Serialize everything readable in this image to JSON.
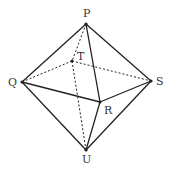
{
  "diagram": {
    "type": "octahedron",
    "colors": {
      "line": "#222222",
      "label": "#333333",
      "background": "#ffffff"
    },
    "vertices": {
      "P": {
        "label": "P",
        "x": 86,
        "y": 24,
        "lx": 83,
        "ly": 17
      },
      "T": {
        "label": "T",
        "x": 72,
        "y": 61,
        "lx": 77,
        "ly": 60
      },
      "Q": {
        "label": "Q",
        "x": 22,
        "y": 82,
        "lx": 8,
        "ly": 86
      },
      "S": {
        "label": "S",
        "x": 151,
        "y": 81,
        "lx": 156,
        "ly": 85
      },
      "R": {
        "label": "R",
        "x": 100,
        "y": 102,
        "lx": 104,
        "ly": 114
      },
      "U": {
        "label": "U",
        "x": 86,
        "y": 150,
        "lx": 82,
        "ly": 163
      }
    },
    "edges": [
      {
        "from": "P",
        "to": "Q",
        "style": "solid"
      },
      {
        "from": "P",
        "to": "S",
        "style": "solid"
      },
      {
        "from": "P",
        "to": "R",
        "style": "solid"
      },
      {
        "from": "Q",
        "to": "R",
        "style": "solid"
      },
      {
        "from": "R",
        "to": "S",
        "style": "solid"
      },
      {
        "from": "Q",
        "to": "U",
        "style": "solid"
      },
      {
        "from": "R",
        "to": "U",
        "style": "solid"
      },
      {
        "from": "S",
        "to": "U",
        "style": "solid"
      },
      {
        "from": "P",
        "to": "T",
        "style": "dashed"
      },
      {
        "from": "T",
        "to": "Q",
        "style": "dashed"
      },
      {
        "from": "T",
        "to": "S",
        "style": "dashed"
      },
      {
        "from": "T",
        "to": "U",
        "style": "dashed"
      }
    ]
  }
}
